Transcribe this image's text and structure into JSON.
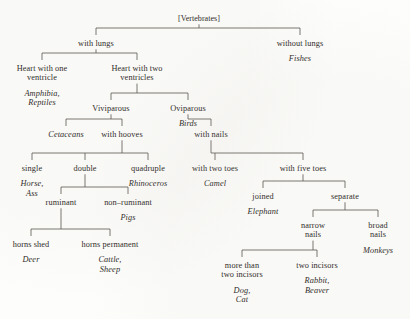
{
  "diagram": {
    "title": "[Vertebrates]",
    "type": "classification-tree",
    "ink_color": "#2a2724",
    "line_color": "#57514b",
    "background_color": "#fdfdfb",
    "nodes": [
      {
        "id": "root",
        "label": "[Vertebrates]",
        "taxa": "",
        "x": 199,
        "y": 14,
        "style": "root"
      },
      {
        "id": "with_lungs",
        "label": "with lungs",
        "taxa": "",
        "x": 96,
        "y": 39,
        "style": "cond"
      },
      {
        "id": "without_lungs",
        "label": "without lungs",
        "taxa": "Fishes",
        "x": 300,
        "y": 39,
        "style": "cond"
      },
      {
        "id": "heart_one",
        "label": "Heart with one\nventricle",
        "taxa": "Amphibia,\nReptiles",
        "x": 42,
        "y": 64,
        "style": "cond"
      },
      {
        "id": "heart_two",
        "label": "Heart with two\nventricles",
        "taxa": "",
        "x": 137,
        "y": 64,
        "style": "cond"
      },
      {
        "id": "viviparous",
        "label": "Viviparous",
        "taxa": "",
        "x": 111,
        "y": 104,
        "style": "cond"
      },
      {
        "id": "oviparous",
        "label": "Oviparous",
        "taxa": "Birds",
        "x": 188,
        "y": 104,
        "style": "cond"
      },
      {
        "id": "cetaceans",
        "label": "",
        "taxa": "Cetaceans",
        "x": 66,
        "y": 130,
        "style": "taxon"
      },
      {
        "id": "with_hooves",
        "label": "with hooves",
        "taxa": "",
        "x": 122,
        "y": 130,
        "style": "cond"
      },
      {
        "id": "with_nails",
        "label": "with nails",
        "taxa": "",
        "x": 211,
        "y": 130,
        "style": "cond"
      },
      {
        "id": "single",
        "label": "single",
        "taxa": "Horse,\nAss",
        "x": 32,
        "y": 164,
        "style": "cond"
      },
      {
        "id": "double",
        "label": "double",
        "taxa": "",
        "x": 85,
        "y": 164,
        "style": "cond"
      },
      {
        "id": "quadruple",
        "label": "quadruple",
        "taxa": "Rhinoceros",
        "x": 148,
        "y": 164,
        "style": "cond"
      },
      {
        "id": "two_toes",
        "label": "with two toes",
        "taxa": "Camel",
        "x": 215,
        "y": 164,
        "style": "cond"
      },
      {
        "id": "five_toes",
        "label": "with five toes",
        "taxa": "",
        "x": 303,
        "y": 164,
        "style": "cond"
      },
      {
        "id": "ruminant",
        "label": "ruminant",
        "taxa": "",
        "x": 61,
        "y": 198,
        "style": "cond"
      },
      {
        "id": "non_ruminant",
        "label": "non–ruminant",
        "taxa": "Pigs",
        "x": 128,
        "y": 198,
        "style": "cond"
      },
      {
        "id": "joined",
        "label": "joined",
        "taxa": "Elephant",
        "x": 263,
        "y": 192,
        "style": "cond"
      },
      {
        "id": "separate",
        "label": "separate",
        "taxa": "",
        "x": 345,
        "y": 192,
        "style": "cond"
      },
      {
        "id": "horns_shed",
        "label": "horns shed",
        "taxa": "Deer",
        "x": 31,
        "y": 240,
        "style": "cond"
      },
      {
        "id": "horns_permanent",
        "label": "horns permanent",
        "taxa": "Cattle,\nSheep",
        "x": 110,
        "y": 240,
        "style": "cond"
      },
      {
        "id": "narrow_nails",
        "label": "narrow\nnails",
        "taxa": "",
        "x": 313,
        "y": 221,
        "style": "cond"
      },
      {
        "id": "broad_nails",
        "label": "broad\nnails",
        "taxa": "Monkeys",
        "x": 378,
        "y": 221,
        "style": "cond"
      },
      {
        "id": "more_incisors",
        "label": "more than\ntwo incisors",
        "taxa": "Dog,\nCat",
        "x": 242,
        "y": 261,
        "style": "cond"
      },
      {
        "id": "two_incisors",
        "label": "two incisors",
        "taxa": "Rabbit,\nBeaver",
        "x": 317,
        "y": 261,
        "style": "cond"
      }
    ],
    "edges": [
      {
        "from": "root",
        "to": "with_lungs"
      },
      {
        "from": "root",
        "to": "without_lungs"
      },
      {
        "from": "with_lungs",
        "to": "heart_one"
      },
      {
        "from": "with_lungs",
        "to": "heart_two"
      },
      {
        "from": "heart_two",
        "to": "viviparous"
      },
      {
        "from": "heart_two",
        "to": "oviparous"
      },
      {
        "from": "viviparous",
        "to": "cetaceans"
      },
      {
        "from": "viviparous",
        "to": "with_hooves"
      },
      {
        "from": "oviparous",
        "to": "with_nails"
      },
      {
        "from": "with_hooves",
        "to": "single"
      },
      {
        "from": "with_hooves",
        "to": "double"
      },
      {
        "from": "with_hooves",
        "to": "quadruple"
      },
      {
        "from": "with_nails",
        "to": "two_toes"
      },
      {
        "from": "with_nails",
        "to": "five_toes"
      },
      {
        "from": "double",
        "to": "ruminant"
      },
      {
        "from": "double",
        "to": "non_ruminant"
      },
      {
        "from": "five_toes",
        "to": "joined"
      },
      {
        "from": "five_toes",
        "to": "separate"
      },
      {
        "from": "ruminant",
        "to": "horns_shed"
      },
      {
        "from": "ruminant",
        "to": "horns_permanent"
      },
      {
        "from": "separate",
        "to": "narrow_nails"
      },
      {
        "from": "separate",
        "to": "broad_nails"
      },
      {
        "from": "narrow_nails",
        "to": "more_incisors"
      },
      {
        "from": "narrow_nails",
        "to": "two_incisors"
      }
    ]
  }
}
